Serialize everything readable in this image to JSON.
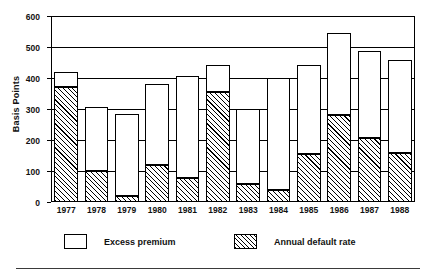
{
  "chart_data": {
    "type": "bar",
    "subtype": "stacked-vertical",
    "title": "",
    "xlabel": "",
    "ylabel": "Basis Points",
    "ylim": [
      0,
      600
    ],
    "ytick_step": 100,
    "yticks": [
      0,
      100,
      200,
      300,
      400,
      500,
      600
    ],
    "ytick_labels": [
      "0",
      "100",
      "200",
      "300",
      "400",
      "500",
      "600"
    ],
    "grid": "horizontal",
    "legend_position": "below-axes",
    "categories": [
      "1977",
      "1978",
      "1979",
      "1980",
      "1981",
      "1982",
      "1983",
      "1984",
      "1985",
      "1986",
      "1987",
      "1988"
    ],
    "series": [
      {
        "name": "Annual default rate",
        "style": "hatched",
        "values": [
          370,
          100,
          20,
          118,
          78,
          355,
          58,
          38,
          155,
          282,
          208,
          157
        ]
      },
      {
        "name": "Excess premium",
        "style": "open",
        "values": [
          50,
          205,
          263,
          262,
          329,
          88,
          242,
          362,
          288,
          263,
          279,
          301
        ]
      }
    ],
    "totals": [
      420,
      305,
      283,
      380,
      407,
      443,
      300,
      400,
      443,
      545,
      487,
      458
    ]
  },
  "axes": {
    "y_title": "Basis Points"
  },
  "legend": {
    "items": [
      {
        "label": "Excess premium",
        "swatch": "open-box"
      },
      {
        "label": "Annual default rate",
        "swatch": "hatched-box"
      }
    ]
  }
}
